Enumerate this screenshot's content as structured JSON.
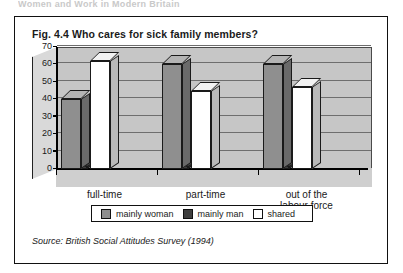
{
  "running_head": "Women and Work in Modern Britain",
  "figure": {
    "label": "Fig. 4.4",
    "title": "Who cares for sick family members?",
    "source_prefix": "Source:",
    "source_text": "British Social Attitudes Survey (1994)"
  },
  "legend": {
    "items": [
      {
        "label": "mainly woman",
        "color": "#8f8f8f"
      },
      {
        "label": "mainly man",
        "color": "#3f3f3f"
      },
      {
        "label": "shared",
        "color": "#ffffff"
      }
    ]
  },
  "chart_data": {
    "type": "bar",
    "title": "Who cares for sick family members?",
    "xlabel": "",
    "ylabel": "",
    "ylim": [
      0,
      70
    ],
    "yticks": [
      0,
      10,
      20,
      30,
      40,
      50,
      60,
      70
    ],
    "ytick_labels": [
      "0",
      "10",
      "20",
      "30",
      "40",
      "50",
      "60",
      "70"
    ],
    "grid": true,
    "legend_position": "bottom",
    "categories": [
      "full-time",
      "part-time",
      "out of the labour force"
    ],
    "category_labels": [
      [
        "full-time"
      ],
      [
        "part-time"
      ],
      [
        "out of the",
        "labour force"
      ]
    ],
    "series": [
      {
        "name": "mainly woman",
        "color": "#8f8f8f",
        "values": [
          40,
          60,
          60
        ]
      },
      {
        "name": "mainly man",
        "color": "#3f3f3f",
        "values": [
          2,
          2,
          2
        ]
      },
      {
        "name": "shared",
        "color": "#ffffff",
        "values": [
          62,
          45,
          47
        ]
      }
    ]
  }
}
